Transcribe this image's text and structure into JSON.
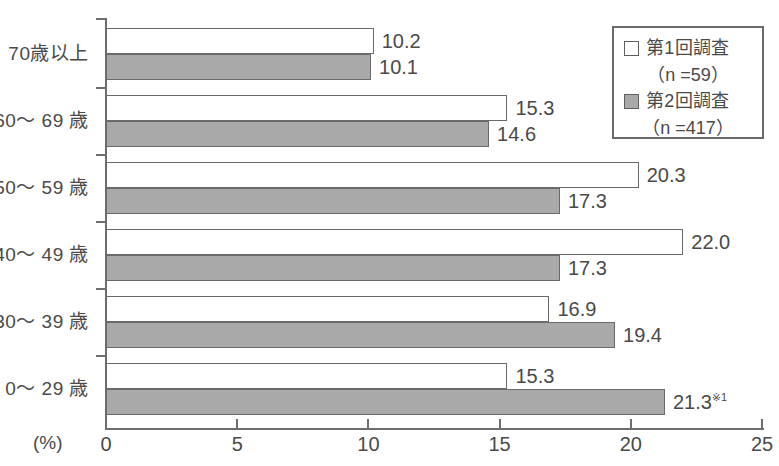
{
  "chart_data": {
    "type": "bar",
    "orientation": "horizontal",
    "title": "",
    "xlabel": "(%)",
    "ylabel": "",
    "xlim": [
      0,
      25
    ],
    "xticks": [
      "0",
      "5",
      "10",
      "15",
      "20",
      "25"
    ],
    "grid": false,
    "legend_position": "top-right",
    "categories": [
      "70歳以上",
      "60〜 69 歳",
      "50〜 59 歳",
      "40〜 49 歳",
      "30〜 39 歳",
      "0〜 29 歳"
    ],
    "series": [
      {
        "name": "第1回調査",
        "sublabel": "（n =59）",
        "color": "#ffffff",
        "values": [
          10.2,
          15.3,
          20.3,
          22.0,
          16.9,
          15.3
        ],
        "labels": [
          "10.2",
          "15.3",
          "20.3",
          "22.0",
          "16.9",
          "15.3"
        ]
      },
      {
        "name": "第2回調査",
        "sublabel": "（n =417）",
        "color": "#a9a9a9",
        "values": [
          10.1,
          14.6,
          17.3,
          17.3,
          19.4,
          21.3
        ],
        "labels": [
          "10.1",
          "14.6",
          "17.3",
          "17.3",
          "19.4",
          "21.3"
        ],
        "label_marks": [
          "",
          "",
          "",
          "",
          "",
          "※1"
        ]
      }
    ]
  },
  "axis": {
    "unit_label": "(%)",
    "tick_labels": [
      "0",
      "5",
      "10",
      "15",
      "20",
      "25"
    ]
  },
  "legend": {
    "items": [
      {
        "swatch": "s1",
        "label": "第1回調査",
        "sub": "（n =59）"
      },
      {
        "swatch": "s2",
        "label": "第2回調査",
        "sub": "（n =417）"
      }
    ]
  }
}
